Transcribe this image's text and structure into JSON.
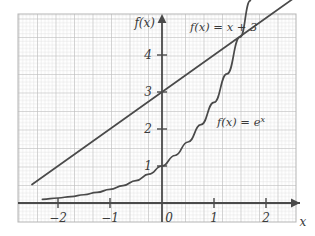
{
  "chart_data": {
    "type": "line",
    "title": "",
    "xlabel": "x",
    "ylabel": "f(x)",
    "grid": true,
    "grid_minor_per_unit": 10,
    "grid_major_every": 5,
    "legend_position": "inline-annotations",
    "xlim": [
      -2.8,
      2.6
    ],
    "ylim": [
      -0.55,
      5.4
    ],
    "xticks": [
      -2,
      -1,
      0,
      1,
      2
    ],
    "yticks": [
      1,
      2,
      3,
      4
    ],
    "xtick_labels": [
      "−2",
      "−1",
      "0",
      "1",
      "2"
    ],
    "ytick_labels": [
      "1",
      "2",
      "3",
      "4"
    ],
    "series": [
      {
        "name": "f(x) = x + 3",
        "expression": "x + 3",
        "x": [
          -2.5,
          -2,
          -1.5,
          -1,
          -0.5,
          0,
          0.5,
          1,
          1.5,
          2,
          2.55
        ],
        "values": [
          0.5,
          1,
          1.5,
          2,
          2.5,
          3,
          3.5,
          4,
          4.5,
          5,
          5.55
        ],
        "y_intercept": 3,
        "slope": 1
      },
      {
        "name": "f(x) = e^x",
        "expression": "e^x",
        "x": [
          -2.3,
          -2,
          -1.75,
          -1.5,
          -1.25,
          -1,
          -0.75,
          -0.5,
          -0.25,
          0,
          0.25,
          0.5,
          0.75,
          1,
          1.25,
          1.5,
          1.7
        ],
        "values": [
          0.1,
          0.135,
          0.174,
          0.223,
          0.287,
          0.368,
          0.472,
          0.607,
          0.779,
          1,
          1.284,
          1.649,
          2.117,
          2.718,
          3.49,
          4.482,
          5.47
        ],
        "y_intercept": 1
      }
    ],
    "annotations": [
      {
        "text": "f(x) = x + 3",
        "x": 0.55,
        "y": 5.05
      },
      {
        "text": "f(x) = e",
        "superscript": "x",
        "x": 1.05,
        "y": 2.45
      }
    ],
    "axis_labels": {
      "y_axis": "f(x)",
      "x_axis": "x"
    }
  },
  "colors": {
    "background": "#ffffff",
    "grid_minor": "#d9d9d9",
    "grid_major": "#bcbcbc",
    "axis": "#444444",
    "curve": "#4a4a4a",
    "text": "#3a3a3a"
  }
}
